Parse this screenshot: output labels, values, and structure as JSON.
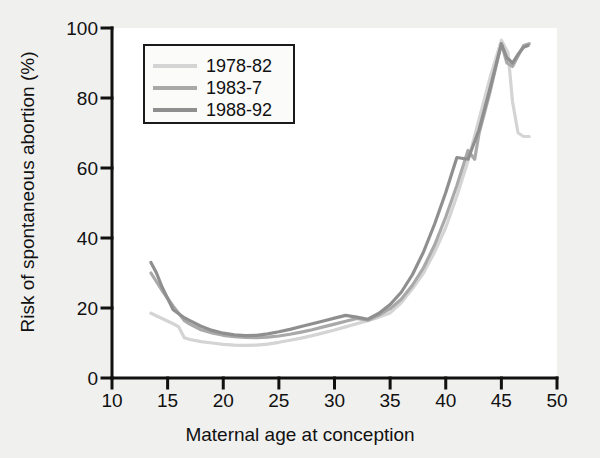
{
  "chart_data": {
    "type": "line",
    "title": "",
    "xlabel": "Maternal age at conception",
    "ylabel": "Risk of spontaneous abortion (%)",
    "xlim": [
      10,
      50
    ],
    "ylim": [
      0,
      100
    ],
    "xticks": [
      10,
      15,
      20,
      25,
      30,
      35,
      40,
      45,
      50
    ],
    "yticks": [
      0,
      20,
      40,
      60,
      80,
      100
    ],
    "grid": false,
    "legend_position": "upper-left-inside",
    "series": [
      {
        "name": "1978-82",
        "color": "#d4d4d4",
        "x": [
          13.5,
          14.5,
          15.5,
          16.0,
          16.5,
          17.0,
          18.0,
          19.0,
          20.0,
          21.0,
          22.0,
          23.0,
          24.0,
          25.0,
          26.0,
          27.0,
          28.0,
          29.0,
          30.0,
          31.0,
          32.0,
          33.0,
          34.0,
          35.0,
          36.0,
          37.0,
          38.0,
          39.0,
          40.0,
          41.0,
          42.0,
          43.0,
          44.0,
          45.0,
          45.6,
          46.0,
          46.5,
          47.0,
          47.5
        ],
        "y": [
          18.5,
          17.0,
          15.5,
          14.6,
          11.5,
          11.0,
          10.4,
          10.0,
          9.6,
          9.4,
          9.3,
          9.4,
          9.7,
          10.2,
          10.8,
          11.4,
          12.1,
          12.9,
          13.7,
          14.6,
          15.5,
          16.4,
          17.4,
          18.6,
          21.5,
          25.5,
          30.0,
          36.0,
          43.0,
          52.0,
          62.0,
          74.0,
          86.0,
          96.5,
          93.0,
          79.0,
          70.0,
          69.0,
          69.0
        ]
      },
      {
        "name": "1983-7",
        "color": "#a9a9a9",
        "x": [
          13.5,
          14.5,
          15.5,
          16.5,
          17.0,
          18.0,
          19.0,
          20.0,
          21.0,
          22.0,
          23.0,
          24.0,
          25.0,
          26.0,
          27.0,
          28.0,
          29.0,
          30.0,
          31.0,
          32.0,
          33.0,
          34.0,
          35.0,
          36.0,
          37.0,
          38.0,
          39.0,
          40.0,
          41.0,
          42.0,
          42.6,
          43.0,
          44.0,
          45.0,
          45.5,
          46.0,
          46.5,
          47.0,
          47.5
        ],
        "y": [
          30.0,
          25.0,
          20.5,
          16.4,
          15.4,
          13.8,
          12.9,
          12.2,
          11.8,
          11.6,
          11.5,
          11.7,
          12.0,
          12.5,
          13.1,
          13.8,
          14.6,
          15.4,
          16.2,
          17.0,
          16.5,
          18.0,
          19.8,
          22.5,
          26.5,
          31.5,
          38.0,
          46.0,
          55.0,
          65.0,
          62.5,
          70.0,
          82.0,
          95.5,
          90.0,
          89.0,
          92.0,
          95.0,
          95.5
        ]
      },
      {
        "name": "1988-92",
        "color": "#8f8f8f",
        "x": [
          13.5,
          14.0,
          14.5,
          15.5,
          16.5,
          17.0,
          18.0,
          19.0,
          20.0,
          21.0,
          22.0,
          23.0,
          24.0,
          25.0,
          26.0,
          27.0,
          28.0,
          29.0,
          30.0,
          31.0,
          32.0,
          33.0,
          34.0,
          35.0,
          36.0,
          37.0,
          38.0,
          39.0,
          40.0,
          41.0,
          42.0,
          43.0,
          44.0,
          45.0,
          45.5,
          46.0,
          46.5,
          47.0,
          47.4
        ],
        "y": [
          33.0,
          30.0,
          26.0,
          19.5,
          17.2,
          16.4,
          14.8,
          13.6,
          12.8,
          12.3,
          12.1,
          12.2,
          12.6,
          13.2,
          13.9,
          14.7,
          15.5,
          16.3,
          17.1,
          17.9,
          17.4,
          16.8,
          18.5,
          21.0,
          24.5,
          29.5,
          36.0,
          44.0,
          53.0,
          63.0,
          62.5,
          71.0,
          83.0,
          95.5,
          91.5,
          90.0,
          92.5,
          94.5,
          95.0
        ]
      }
    ]
  },
  "legend": {
    "entries": [
      {
        "label": "1978-82",
        "color": "#d4d4d4"
      },
      {
        "label": "1983-7",
        "color": "#a9a9a9"
      },
      {
        "label": "1988-92",
        "color": "#8f8f8f"
      }
    ]
  },
  "axes": {
    "x_title": "Maternal age at conception",
    "y_title": "Risk of spontaneous abortion (%)",
    "x_tick_labels": [
      "10",
      "15",
      "20",
      "25",
      "30",
      "35",
      "40",
      "45",
      "50"
    ],
    "y_tick_labels": [
      "0",
      "20",
      "40",
      "60",
      "80",
      "100"
    ]
  },
  "colors": {
    "background": "#f0f0ee",
    "plot_background": "#ffffff",
    "axis": "#111111",
    "text": "#111111"
  }
}
